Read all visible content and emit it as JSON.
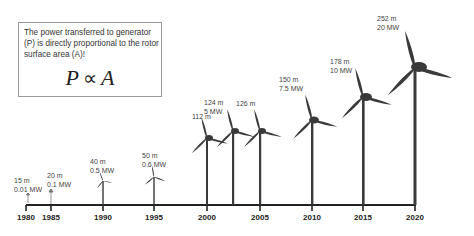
{
  "info_box": {
    "text": "The power transferred to generator (P) is directly proportional to the rotor surface area (A)!",
    "formula_left": "P",
    "formula_symbol": "∝",
    "formula_right": "A"
  },
  "axis": {
    "years": [
      "1980",
      "1985",
      "1990",
      "1995",
      "2000",
      "2005",
      "2010",
      "2015",
      "2020"
    ]
  },
  "turbines": [
    {
      "year": "1980",
      "diameter": "15 m",
      "power": "0.01 MW"
    },
    {
      "year": "1985",
      "diameter": "20 m",
      "power": "0.1 MW"
    },
    {
      "year": "1990",
      "diameter": "40 m",
      "power": "0.5 MW"
    },
    {
      "year": "1995",
      "diameter": "50 m",
      "power": "0.6 MW"
    },
    {
      "year": "2000",
      "diameter": "112 m",
      "power": ""
    },
    {
      "year": "2003",
      "diameter": "124 m",
      "power": "5 MW"
    },
    {
      "year": "2005",
      "diameter": "126 m",
      "power": ""
    },
    {
      "year": "2010",
      "diameter": "150 m",
      "power": "7.5 MW"
    },
    {
      "year": "2015",
      "diameter": "178 m",
      "power": "10 MW"
    },
    {
      "year": "2020",
      "diameter": "252 m",
      "power": "20 MW"
    }
  ],
  "colors": {
    "turbine": "#3a3a3a",
    "axis": "#222222",
    "box_border": "#9a9a9a"
  }
}
